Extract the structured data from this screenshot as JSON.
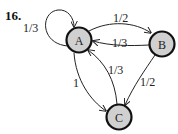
{
  "problem_number": "16.",
  "colors": {
    "node_fill": "#d0d0d0",
    "node_stroke": "#111111",
    "edge": "#222222"
  },
  "nodes": [
    {
      "id": "A",
      "label": "A"
    },
    {
      "id": "B",
      "label": "B"
    },
    {
      "id": "C",
      "label": "C"
    }
  ],
  "edges": [
    {
      "from": "A",
      "to": "A",
      "label": "1/3"
    },
    {
      "from": "A",
      "to": "B",
      "label": "1/2"
    },
    {
      "from": "B",
      "to": "A",
      "label": "1/3"
    },
    {
      "from": "A",
      "to": "C",
      "label": "1"
    },
    {
      "from": "C",
      "to": "A",
      "label": "1/3"
    },
    {
      "from": "B",
      "to": "C",
      "label": "1/2"
    }
  ]
}
